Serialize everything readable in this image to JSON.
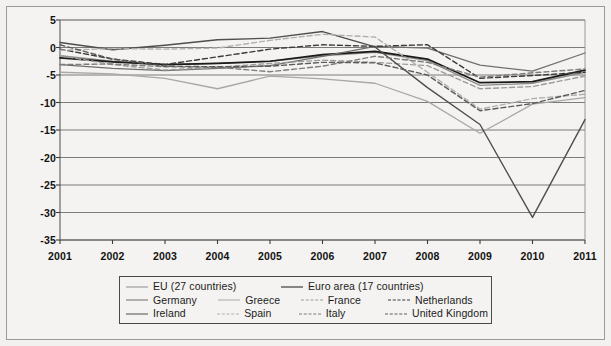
{
  "figure": {
    "background_color": "#f2f1ef",
    "plot_background_color": "#f4f3f1",
    "frame_color": "#9a9a98"
  },
  "chart_data": {
    "type": "line",
    "title": "",
    "subtitle": "",
    "xlabel": "",
    "ylabel": "",
    "x": [
      2001,
      2002,
      2003,
      2004,
      2005,
      2006,
      2007,
      2008,
      2009,
      2010,
      2011
    ],
    "categories": [
      "2001",
      "2002",
      "2003",
      "2004",
      "2005",
      "2006",
      "2007",
      "2008",
      "2009",
      "2010",
      "2011"
    ],
    "xlim": [
      2001,
      2011
    ],
    "ylim": [
      -35,
      5
    ],
    "yticks": [
      5,
      0,
      -5,
      -10,
      -15,
      -20,
      -25,
      -30,
      -35
    ],
    "ytick_labels": [
      "5",
      "0",
      "-5",
      "-10",
      "-15",
      "-20",
      "-25",
      "-30",
      "-35"
    ],
    "xticks": [
      2001,
      2002,
      2003,
      2004,
      2005,
      2006,
      2007,
      2008,
      2009,
      2010,
      2011
    ],
    "xtick_labels": [
      "2001",
      "2002",
      "2003",
      "2004",
      "2005",
      "2006",
      "2007",
      "2008",
      "2009",
      "2010",
      "2011"
    ],
    "grid": "horizontal",
    "legend_position": "bottom",
    "series": [
      {
        "name": "EU (27 countries)",
        "legend_id": "eu-27",
        "color": "#8d8d8b",
        "dash": "none",
        "width": 1.3,
        "values": [
          -1.5,
          -2.5,
          -3.1,
          -2.9,
          -2.5,
          -1.5,
          -0.9,
          -2.4,
          -6.9,
          -6.5,
          -4.5
        ]
      },
      {
        "name": "Euro area (17 countries)",
        "legend_id": "euro-area-17",
        "color": "#1a1a1a",
        "dash": "none",
        "width": 1.7,
        "values": [
          -1.9,
          -2.6,
          -3.1,
          -2.9,
          -2.5,
          -1.3,
          -0.7,
          -2.1,
          -6.4,
          -6.2,
          -4.1
        ]
      },
      {
        "name": "Germany",
        "legend_id": "germany",
        "color": "#6f6f6d",
        "dash": "none",
        "width": 1.3,
        "values": [
          -3.1,
          -3.8,
          -4.2,
          -3.8,
          -3.3,
          -1.6,
          0.2,
          -0.1,
          -3.2,
          -4.3,
          -1.0
        ]
      },
      {
        "name": "Greece",
        "legend_id": "greece",
        "color": "#a8a8a6",
        "dash": "none",
        "width": 1.3,
        "values": [
          -4.5,
          -4.8,
          -5.6,
          -7.5,
          -5.2,
          -5.7,
          -6.5,
          -9.8,
          -15.6,
          -10.3,
          -9.1
        ]
      },
      {
        "name": "France",
        "legend_id": "france",
        "color": "#9b9b99",
        "dash": "dashed",
        "width": 1.4,
        "values": [
          -1.5,
          -3.1,
          -4.1,
          -3.6,
          -2.9,
          -2.3,
          -2.7,
          -3.3,
          -7.5,
          -7.1,
          -5.2
        ]
      },
      {
        "name": "Netherlands",
        "legend_id": "netherlands",
        "color": "#3a3a38",
        "dash": "dashed",
        "width": 1.4,
        "values": [
          -0.3,
          -2.1,
          -3.1,
          -1.7,
          -0.3,
          0.5,
          0.2,
          0.5,
          -5.6,
          -5.1,
          -4.5
        ]
      },
      {
        "name": "Ireland",
        "legend_id": "ireland",
        "color": "#4e4e4c",
        "dash": "none",
        "width": 1.4,
        "values": [
          0.9,
          -0.4,
          0.4,
          1.4,
          1.7,
          2.9,
          0.1,
          -7.3,
          -14.0,
          -30.9,
          -13.1
        ]
      },
      {
        "name": "Spain",
        "legend_id": "spain",
        "color": "#b0b0ae",
        "dash": "dashed",
        "width": 1.4,
        "values": [
          -0.5,
          -0.2,
          -0.3,
          -0.1,
          1.3,
          2.4,
          1.9,
          -4.5,
          -11.2,
          -9.3,
          -8.5
        ]
      },
      {
        "name": "Italy",
        "legend_id": "italy",
        "color": "#7d7d7b",
        "dash": "dashed",
        "width": 1.4,
        "values": [
          -3.1,
          -3.0,
          -3.5,
          -3.6,
          -4.4,
          -3.4,
          -1.6,
          -2.7,
          -5.4,
          -4.6,
          -3.9
        ]
      },
      {
        "name": "United Kingdom",
        "legend_id": "united-kingdom",
        "color": "#5c5c5a",
        "dash": "dashed",
        "width": 1.4,
        "values": [
          0.5,
          -2.1,
          -3.4,
          -3.5,
          -3.4,
          -2.7,
          -2.8,
          -5.0,
          -11.5,
          -10.2,
          -7.8
        ]
      }
    ]
  },
  "legend": {
    "rows": [
      [
        {
          "label": "EU (27 countries)",
          "series": "eu-27",
          "width": 155
        },
        {
          "label": "Euro area (17 countries)",
          "series": "euro-area-17",
          "width": 200
        }
      ],
      [
        {
          "label": "Germany",
          "series": "germany",
          "width": 95
        },
        {
          "label": "Greece",
          "series": "greece",
          "width": 85
        },
        {
          "label": "France",
          "series": "france",
          "width": 90
        },
        {
          "label": "Netherlands",
          "series": "netherlands",
          "width": 100
        }
      ],
      [
        {
          "label": "Ireland",
          "series": "ireland",
          "width": 95
        },
        {
          "label": "Spain",
          "series": "spain",
          "width": 85
        },
        {
          "label": "Italy",
          "series": "italy",
          "width": 90
        },
        {
          "label": "United Kingdom",
          "series": "united-kingdom",
          "width": 100
        }
      ]
    ]
  }
}
